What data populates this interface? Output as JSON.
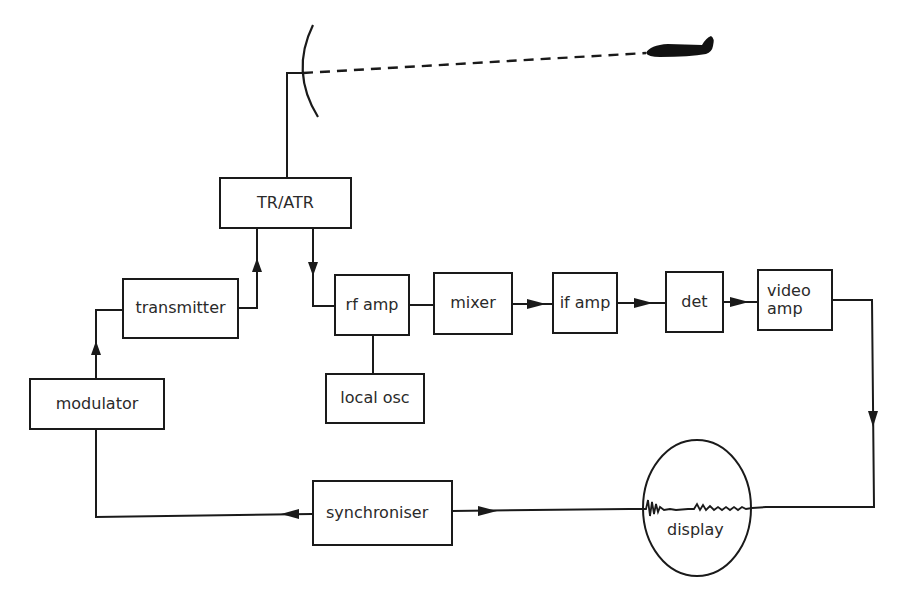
{
  "diagram": {
    "blocks": {
      "tr_atr": "TR/ATR",
      "transmitter": "transmitter",
      "modulator": "modulator",
      "rf_amp": "rf amp",
      "mixer": "mixer",
      "if_amp": "if amp",
      "det": "det",
      "video_amp_line1": "video",
      "video_amp_line2": "amp",
      "local_osc": "local osc",
      "synchroniser": "synchroniser",
      "display": "display"
    },
    "icons": {
      "antenna": "parabolic-antenna-icon",
      "target": "aircraft-target-icon",
      "echo_trace": "radar-echo-trace"
    },
    "connections": [
      {
        "from": "antenna",
        "to": "tr_atr",
        "arrow": false
      },
      {
        "from": "transmitter",
        "to": "tr_atr",
        "arrow": true
      },
      {
        "from": "tr_atr",
        "to": "rf_amp",
        "arrow": true
      },
      {
        "from": "modulator",
        "to": "transmitter",
        "arrow": true
      },
      {
        "from": "rf_amp",
        "to": "mixer",
        "arrow": false
      },
      {
        "from": "local_osc",
        "to": "rf_amp",
        "arrow": false
      },
      {
        "from": "mixer",
        "to": "if_amp",
        "arrow": true
      },
      {
        "from": "if_amp",
        "to": "det",
        "arrow": true
      },
      {
        "from": "det",
        "to": "video_amp",
        "arrow": true
      },
      {
        "from": "video_amp",
        "to": "display",
        "arrow": true
      },
      {
        "from": "synchroniser",
        "to": "display",
        "arrow": true
      },
      {
        "from": "synchroniser",
        "to": "modulator",
        "arrow": true
      },
      {
        "from": "antenna",
        "to": "target",
        "style": "dashed"
      }
    ],
    "colors": {
      "line": "#1a1a1a",
      "text": "#2a2a2a",
      "background": "#ffffff"
    }
  }
}
